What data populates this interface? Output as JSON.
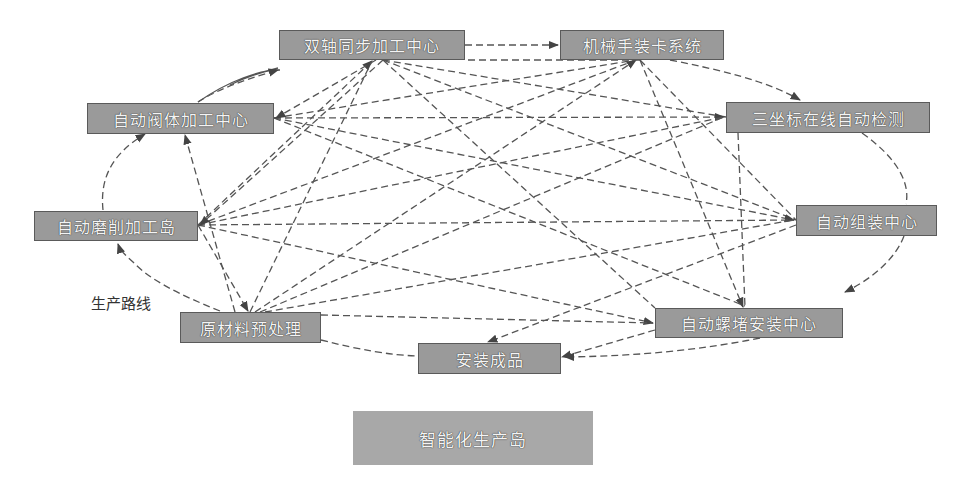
{
  "diagram": {
    "nodes": [
      {
        "id": "n1",
        "label": "双轴同步加工中心",
        "x": 279,
        "y": 30,
        "w": 186,
        "h": 30
      },
      {
        "id": "n2",
        "label": "机械手装卡系统",
        "x": 560,
        "y": 30,
        "w": 164,
        "h": 30
      },
      {
        "id": "n3",
        "label": "三坐标在线自动检测",
        "x": 726,
        "y": 102,
        "w": 204,
        "h": 31
      },
      {
        "id": "n4",
        "label": "自动组装中心",
        "x": 796,
        "y": 205,
        "w": 141,
        "h": 31
      },
      {
        "id": "n5",
        "label": "自动螺堵安装中心",
        "x": 655,
        "y": 308,
        "w": 188,
        "h": 30
      },
      {
        "id": "n6",
        "label": "安装成品",
        "x": 418,
        "y": 343,
        "w": 143,
        "h": 31
      },
      {
        "id": "n7",
        "label": "原材料预处理",
        "x": 180,
        "y": 312,
        "w": 141,
        "h": 31
      },
      {
        "id": "n8",
        "label": "自动磨削加工岛",
        "x": 34,
        "y": 211,
        "w": 164,
        "h": 30
      },
      {
        "id": "n9",
        "label": "自动阀体加工中心",
        "x": 87,
        "y": 103,
        "w": 187,
        "h": 31
      }
    ],
    "route_label": "生产路线",
    "legend": {
      "label": "智能化生产岛"
    },
    "colors": {
      "node_fill": "#9a9a9a",
      "node_border": "#5a5a5a",
      "line": "#555555",
      "legend_fill": "#a8a8a8"
    },
    "main_route": [
      "原材料预处理",
      "自动磨削加工岛",
      "自动阀体加工中心",
      "双轴同步加工中心",
      "机械手装卡系统",
      "三坐标在线自动检测",
      "自动组装中心",
      "自动螺堵安装中心",
      "安装成品"
    ]
  }
}
